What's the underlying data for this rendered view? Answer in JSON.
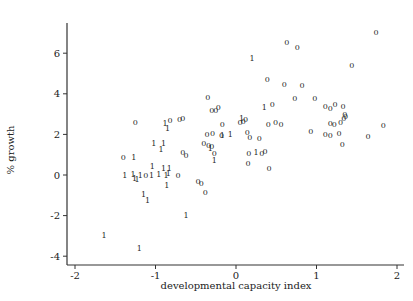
{
  "chart_data": {
    "type": "scatter",
    "title": "",
    "xlabel": "developmental capacity index",
    "ylabel": "% growth",
    "xlim": [
      -2.1,
      2.1
    ],
    "ylim": [
      -4.4,
      7.5
    ],
    "x_ticks": [
      -2,
      -1,
      0,
      1,
      2
    ],
    "y_ticks": [
      -4,
      -2,
      0,
      2,
      4,
      6
    ],
    "grid": false,
    "legend": null,
    "marker_note": "points plotted as text glyphs '0' and '1' denoting group",
    "series": [
      {
        "name": "0",
        "marker": "0",
        "points": [
          [
            1.74,
            7.05
          ],
          [
            0.63,
            6.55
          ],
          [
            0.76,
            6.3
          ],
          [
            1.44,
            5.4
          ],
          [
            0.39,
            4.75
          ],
          [
            0.6,
            4.5
          ],
          [
            0.82,
            4.45
          ],
          [
            0.73,
            3.8
          ],
          [
            0.98,
            3.8
          ],
          [
            1.11,
            3.4
          ],
          [
            1.17,
            3.3
          ],
          [
            1.23,
            3.5
          ],
          [
            1.33,
            3.4
          ],
          [
            1.35,
            3.0
          ],
          [
            1.34,
            2.8
          ],
          [
            1.36,
            2.9
          ],
          [
            1.3,
            2.6
          ],
          [
            1.83,
            2.45
          ],
          [
            1.64,
            1.9
          ],
          [
            0.93,
            2.15
          ],
          [
            1.11,
            2.0
          ],
          [
            1.17,
            1.95
          ],
          [
            1.28,
            2.05
          ],
          [
            1.32,
            1.55
          ],
          [
            1.17,
            2.55
          ],
          [
            1.22,
            2.5
          ],
          [
            -0.35,
            3.85
          ],
          [
            -0.3,
            3.2
          ],
          [
            -0.25,
            3.2
          ],
          [
            -0.22,
            3.35
          ],
          [
            -0.66,
            2.8
          ],
          [
            -0.17,
            2.5
          ],
          [
            0.45,
            3.5
          ],
          [
            0.05,
            2.6
          ],
          [
            0.09,
            2.65
          ],
          [
            0.12,
            2.75
          ],
          [
            0.4,
            2.5
          ],
          [
            -0.36,
            2.0
          ],
          [
            -0.29,
            2.05
          ],
          [
            -0.18,
            1.95
          ],
          [
            -0.4,
            1.6
          ],
          [
            -0.34,
            1.5
          ],
          [
            -0.3,
            1.45
          ],
          [
            -0.27,
            1.1
          ],
          [
            0.14,
            2.1
          ],
          [
            0.17,
            1.85
          ],
          [
            0.29,
            1.8
          ],
          [
            0.16,
            1.1
          ],
          [
            0.32,
            1.1
          ],
          [
            0.36,
            1.2
          ],
          [
            0.15,
            0.6
          ],
          [
            0.41,
            0.35
          ],
          [
            0.56,
            2.5
          ],
          [
            0.49,
            2.6
          ],
          [
            -0.47,
            -0.3
          ],
          [
            -0.38,
            -0.85
          ],
          [
            -0.43,
            -0.4
          ],
          [
            -1.25,
            2.6
          ],
          [
            -1.4,
            0.9
          ],
          [
            -0.82,
            2.7
          ],
          [
            -0.7,
            2.75
          ],
          [
            -1.12,
            0.0
          ],
          [
            -0.62,
            1.0
          ],
          [
            -0.66,
            1.15
          ],
          [
            -0.72,
            0.0
          ]
        ]
      },
      {
        "name": "1",
        "marker": "1",
        "points": [
          [
            0.2,
            5.75
          ],
          [
            0.35,
            3.35
          ],
          [
            0.07,
            2.8
          ],
          [
            -0.07,
            2.0
          ],
          [
            -0.27,
            0.75
          ],
          [
            0.25,
            1.15
          ],
          [
            -0.85,
            2.3
          ],
          [
            -1.02,
            1.6
          ],
          [
            -0.88,
            2.55
          ],
          [
            -0.9,
            1.6
          ],
          [
            -0.93,
            1.3
          ],
          [
            -1.27,
            0.9
          ],
          [
            -1.38,
            0.0
          ],
          [
            -1.28,
            0.05
          ],
          [
            -1.26,
            -0.15
          ],
          [
            -1.23,
            -0.2
          ],
          [
            -1.19,
            0.0
          ],
          [
            -1.05,
            0.0
          ],
          [
            -0.96,
            0.05
          ],
          [
            -0.87,
            0.0
          ],
          [
            -1.04,
            0.45
          ],
          [
            -0.9,
            0.35
          ],
          [
            -0.83,
            0.35
          ],
          [
            -0.84,
            0.1
          ],
          [
            -0.86,
            -0.5
          ],
          [
            -1.15,
            -0.95
          ],
          [
            -1.1,
            -1.25
          ],
          [
            -0.62,
            -1.95
          ],
          [
            -1.64,
            -2.95
          ],
          [
            -1.2,
            -3.6
          ],
          [
            -0.17,
            1.95
          ],
          [
            -0.32,
            1.35
          ]
        ]
      }
    ]
  }
}
